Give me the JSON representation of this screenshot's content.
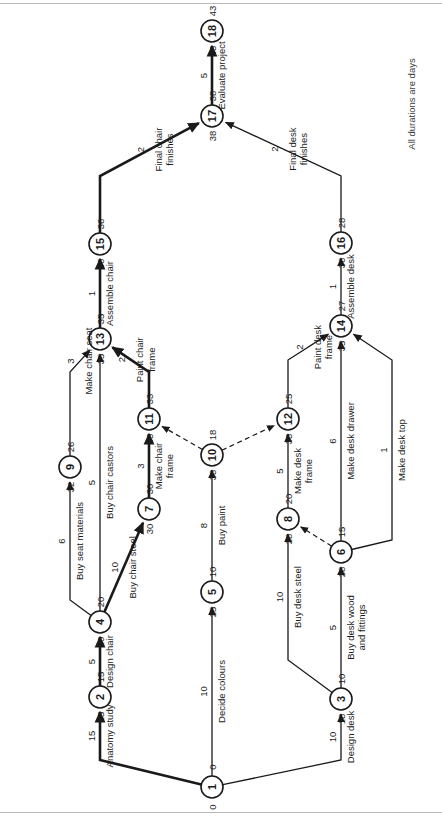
{
  "figure": {
    "type": "activity-on-arrow-network-diagram",
    "note": "All durations are days",
    "orientation": "rotated-90-ccw"
  },
  "legend": {
    "node_format": "earliest-start (left) / node-id (centre) / latest-finish (right)"
  },
  "nodes": [
    {
      "id": "1",
      "early": "0",
      "late": "0",
      "x": 212,
      "y": 787
    },
    {
      "id": "2",
      "early": "15",
      "late": "15",
      "x": 100,
      "y": 697
    },
    {
      "id": "3",
      "early": "10",
      "late": "18",
      "x": 341,
      "y": 699
    },
    {
      "id": "4",
      "early": "20",
      "late": "20",
      "x": 100,
      "y": 622
    },
    {
      "id": "5",
      "early": "10",
      "late": "25",
      "x": 212,
      "y": 592
    },
    {
      "id": "6",
      "early": "15",
      "late": "28",
      "x": 341,
      "y": 552
    },
    {
      "id": "7",
      "early": "30",
      "late": "30",
      "x": 149,
      "y": 509
    },
    {
      "id": "8",
      "early": "20",
      "late": "28",
      "x": 288,
      "y": 519
    },
    {
      "id": "9",
      "early": "26",
      "late": "32",
      "x": 70,
      "y": 467
    },
    {
      "id": "10",
      "early": "18",
      "late": "33",
      "x": 212,
      "y": 455
    },
    {
      "id": "11",
      "early": "33",
      "late": "33",
      "x": 149,
      "y": 419
    },
    {
      "id": "12",
      "early": "25",
      "late": "33",
      "x": 288,
      "y": 419
    },
    {
      "id": "13",
      "early": "35",
      "late": "35",
      "x": 100,
      "y": 339
    },
    {
      "id": "14",
      "early": "27",
      "late": "35",
      "x": 341,
      "y": 326
    },
    {
      "id": "15",
      "early": "36",
      "late": "36",
      "x": 100,
      "y": 244
    },
    {
      "id": "16",
      "early": "28",
      "late": "36",
      "x": 341,
      "y": 243
    },
    {
      "id": "17",
      "early": "38",
      "late": "38",
      "x": 212,
      "y": 116
    },
    {
      "id": "18",
      "early": "43",
      "late": "43",
      "x": 212,
      "y": 31
    }
  ],
  "activities": [
    {
      "name": "Anatomy study",
      "duration": "15",
      "from": "1",
      "to": "2",
      "critical": true
    },
    {
      "name": "Decide colours",
      "duration": "10",
      "from": "1",
      "to": "5",
      "critical": false
    },
    {
      "name": "Design desk",
      "duration": "10",
      "from": "1",
      "to": "3",
      "critical": false
    },
    {
      "name": "Design chair",
      "duration": "5",
      "from": "2",
      "to": "4",
      "critical": true
    },
    {
      "name": "Buy seat materials",
      "duration": "6",
      "from": "4",
      "to": "9",
      "critical": false
    },
    {
      "name": "Buy chair castors",
      "duration": "5",
      "from": "4",
      "to": "13",
      "critical": false
    },
    {
      "name": "Buy chair steel",
      "duration": "10",
      "from": "4",
      "to": "7",
      "critical": true
    },
    {
      "name": "Buy desk steel",
      "duration": "10",
      "from": "3",
      "to": "8",
      "critical": false
    },
    {
      "name": "Buy desk wood and fittings",
      "duration": "5",
      "from": "3",
      "to": "6",
      "critical": false
    },
    {
      "name": "Buy paint",
      "duration": "8",
      "from": "5",
      "to": "10",
      "critical": false
    },
    {
      "name": "Make chair seat",
      "duration": "3",
      "from": "9",
      "to": "13",
      "critical": false
    },
    {
      "name": "Make chair frame",
      "duration": "3",
      "from": "7",
      "to": "11",
      "critical": true
    },
    {
      "name": "Make desk frame",
      "duration": "5",
      "from": "8",
      "to": "12",
      "critical": false
    },
    {
      "name": "Make desk drawer",
      "duration": "6",
      "from": "6",
      "to": "14",
      "critical": false
    },
    {
      "name": "Make desk top",
      "duration": "1",
      "from": "6",
      "to": "14",
      "critical": false
    },
    {
      "name": "Paint chair frame",
      "duration": "2",
      "from": "11",
      "to": "13",
      "critical": true
    },
    {
      "name": "Paint desk frame",
      "duration": "2",
      "from": "12",
      "to": "14",
      "critical": false
    },
    {
      "name": "Assemble chair",
      "duration": "1",
      "from": "13",
      "to": "15",
      "critical": true
    },
    {
      "name": "Assemble desk",
      "duration": "1",
      "from": "14",
      "to": "16",
      "critical": false
    },
    {
      "name": "Final chair finishes",
      "duration": "2",
      "from": "15",
      "to": "17",
      "critical": true
    },
    {
      "name": "Final desk finishes",
      "duration": "2",
      "from": "16",
      "to": "17",
      "critical": false
    },
    {
      "name": "Evaluate project",
      "duration": "5",
      "from": "17",
      "to": "18",
      "critical": true
    }
  ],
  "dummies": [
    {
      "from": "10",
      "to": "11"
    },
    {
      "from": "10",
      "to": "12"
    },
    {
      "from": "6",
      "to": "8"
    }
  ],
  "chart_data": {
    "type": "diagram",
    "title": "",
    "annotations": [
      "All durations are days"
    ]
  }
}
